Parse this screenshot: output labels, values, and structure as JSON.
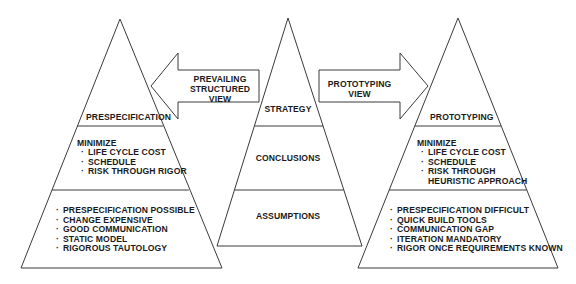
{
  "diagram": {
    "type": "three-pyramid comparison",
    "colors": {
      "line": "#3a3a3a",
      "text": "#1a1a1a",
      "background": "#ffffff"
    },
    "left_pyramid": {
      "top_label": "PRESPECIFICATION",
      "middle": {
        "heading": "MINIMIZE",
        "items": [
          "LIFE CYCLE COST",
          "SCHEDULE",
          "RISK THROUGH RIGOR"
        ]
      },
      "bottom": {
        "items": [
          "PRESPECIFICATION POSSIBLE",
          "CHANGE EXPENSIVE",
          "GOOD COMMUNICATION",
          "STATIC MODEL",
          "RIGOROUS TAUTOLOGY"
        ]
      }
    },
    "center_pyramid": {
      "top_label": "STRATEGY",
      "middle_label": "CONCLUSIONS",
      "bottom_label": "ASSUMPTIONS"
    },
    "right_pyramid": {
      "top_label": "PROTOTYPING",
      "middle": {
        "heading": "MINIMIZE",
        "items": [
          "LIFE CYCLE COST",
          "SCHEDULE",
          "RISK THROUGH"
        ],
        "continuation": "HEURISTIC APPROACH"
      },
      "bottom": {
        "items": [
          "PRESPECIFICATION DIFFICULT",
          "QUICK BUILD TOOLS",
          "COMMUNICATION GAP",
          "ITERATION MANDATORY",
          "RIGOR ONCE REQUIREMENTS KNOWN"
        ]
      }
    },
    "left_arrow": {
      "direction": "left",
      "lines": [
        "PREVAILING",
        "STRUCTURED",
        "VIEW"
      ]
    },
    "right_arrow": {
      "direction": "right",
      "lines": [
        "PROTOTYPING",
        "VIEW"
      ]
    }
  }
}
